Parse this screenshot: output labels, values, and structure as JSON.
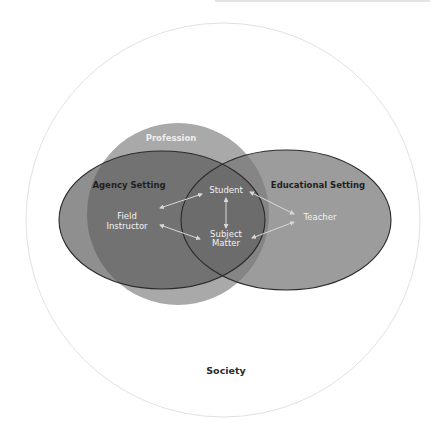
{
  "diagram": {
    "outer_circle": {
      "label": "Society",
      "stroke": "#e2e2e2"
    },
    "profession_circle": {
      "label": "Profession",
      "fill": "#a9a9a9"
    },
    "agency_setting": {
      "label": "Agency Setting",
      "fill": "#8c8c8c"
    },
    "educational_setting": {
      "label": "Educational Setting",
      "fill": "#9c9c9c"
    },
    "nodes": {
      "field_instructor": [
        "Field",
        "Instructor"
      ],
      "student": "Student",
      "subject_matter": [
        "Subject",
        "Matter"
      ],
      "teacher": "Teacher"
    },
    "connections": [
      {
        "from": "Field Instructor",
        "to": "Student",
        "bidirectional": true
      },
      {
        "from": "Field Instructor",
        "to": "Subject Matter",
        "bidirectional": true
      },
      {
        "from": "Student",
        "to": "Subject Matter",
        "bidirectional": true
      },
      {
        "from": "Student",
        "to": "Teacher",
        "bidirectional": true
      },
      {
        "from": "Subject Matter",
        "to": "Teacher",
        "bidirectional": true
      }
    ],
    "colors": {
      "ellipse_stroke": "#2a2a2a",
      "arrow": "#d8d8d8",
      "node_text": "#f2f2f2"
    }
  }
}
